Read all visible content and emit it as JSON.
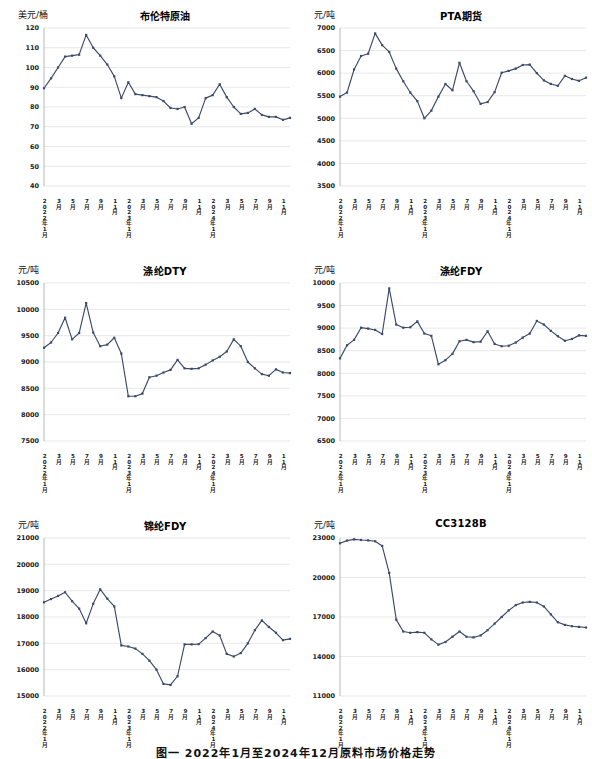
{
  "caption": "图一 2022年1月至2024年12月原料市场价格走势",
  "accent_color": "#3c4a6b",
  "gridline_color": "#d9d9d9",
  "x_labels": [
    "2022年1月",
    "3月",
    "5月",
    "7月",
    "9月",
    "11月",
    "2023年1月",
    "3月",
    "5月",
    "7月",
    "9月",
    "11月",
    "2024年1月",
    "3月",
    "5月",
    "7月",
    "9月",
    "11月"
  ],
  "charts": [
    {
      "chart_data": {
        "type": "line",
        "title": "布伦特原油",
        "ylabel": "美元/桶",
        "xlabel": "",
        "ylim": [
          40,
          120
        ],
        "yticks": [
          40,
          50,
          60,
          70,
          80,
          90,
          100,
          110,
          120
        ],
        "grid": true,
        "legend": "none",
        "x": [
          "2022-01",
          "2022-02",
          "2022-03",
          "2022-04",
          "2022-05",
          "2022-06",
          "2022-07",
          "2022-08",
          "2022-09",
          "2022-10",
          "2022-11",
          "2022-12",
          "2023-01",
          "2023-02",
          "2023-03",
          "2023-04",
          "2023-05",
          "2023-06",
          "2023-07",
          "2023-08",
          "2023-09",
          "2023-10",
          "2023-11",
          "2023-12",
          "2024-01",
          "2024-02",
          "2024-03",
          "2024-04",
          "2024-05",
          "2024-06",
          "2024-07",
          "2024-08",
          "2024-09",
          "2024-10",
          "2024-11",
          "2024-12"
        ],
        "values": [
          89.5,
          94.5,
          100.0,
          105.5,
          106.0,
          106.5,
          116.5,
          110.0,
          106.0,
          101.5,
          95.5,
          84.5,
          92.5,
          86.5,
          86.0,
          85.5,
          85.0,
          83.0,
          79.5,
          79.0,
          80.0,
          71.5,
          74.5,
          84.5,
          86.0,
          91.5,
          85.0,
          80.0,
          76.5,
          77.0,
          79.0,
          76.0,
          75.0,
          75.0,
          73.5,
          74.5
        ]
      }
    },
    {
      "chart_data": {
        "type": "line",
        "title": "PTA期货",
        "ylabel": "元/吨",
        "xlabel": "",
        "ylim": [
          3500,
          7000
        ],
        "yticks": [
          3500,
          4000,
          4500,
          5000,
          5500,
          6000,
          6500,
          7000
        ],
        "grid": true,
        "legend": "none",
        "x": [
          "2022-01",
          "2022-02",
          "2022-03",
          "2022-04",
          "2022-05",
          "2022-06",
          "2022-07",
          "2022-08",
          "2022-09",
          "2022-10",
          "2022-11",
          "2022-12",
          "2023-01",
          "2023-02",
          "2023-03",
          "2023-04",
          "2023-05",
          "2023-06",
          "2023-07",
          "2023-08",
          "2023-09",
          "2023-10",
          "2023-11",
          "2023-12",
          "2024-01",
          "2024-02",
          "2024-03",
          "2024-04",
          "2024-05",
          "2024-06",
          "2024-07",
          "2024-08",
          "2024-09",
          "2024-10",
          "2024-11",
          "2024-12"
        ],
        "values": [
          5480,
          5570,
          6080,
          6380,
          6430,
          6880,
          6620,
          6470,
          6100,
          5820,
          5570,
          5380,
          5000,
          5170,
          5480,
          5760,
          5620,
          6230,
          5820,
          5600,
          5320,
          5360,
          5580,
          6010,
          6050,
          6100,
          6180,
          6190,
          6000,
          5840,
          5760,
          5720,
          5940,
          5870,
          5830,
          5900
        ]
      }
    },
    {
      "chart_data": {
        "type": "line",
        "title": "涤纶DTY",
        "ylabel": "元/吨",
        "xlabel": "",
        "ylim": [
          7500,
          10500
        ],
        "yticks": [
          7500,
          8000,
          8500,
          9000,
          9500,
          10000,
          10500
        ],
        "grid": true,
        "legend": "none",
        "x": [
          "2022-01",
          "2022-02",
          "2022-03",
          "2022-04",
          "2022-05",
          "2022-06",
          "2022-07",
          "2022-08",
          "2022-09",
          "2022-10",
          "2022-11",
          "2022-12",
          "2023-01",
          "2023-02",
          "2023-03",
          "2023-04",
          "2023-05",
          "2023-06",
          "2023-07",
          "2023-08",
          "2023-09",
          "2023-10",
          "2023-11",
          "2023-12",
          "2024-01",
          "2024-02",
          "2024-03",
          "2024-04",
          "2024-05",
          "2024-06",
          "2024-07",
          "2024-08",
          "2024-09",
          "2024-10",
          "2024-11",
          "2024-12"
        ],
        "values": [
          9270,
          9370,
          9550,
          9840,
          9430,
          9550,
          10120,
          9560,
          9300,
          9330,
          9460,
          9160,
          8350,
          8350,
          8400,
          8710,
          8740,
          8800,
          8850,
          9040,
          8880,
          8870,
          8880,
          8950,
          9030,
          9100,
          9200,
          9430,
          9300,
          9000,
          8880,
          8770,
          8740,
          8860,
          8800,
          8790
        ]
      }
    },
    {
      "chart_data": {
        "type": "line",
        "title": "涤纶FDY",
        "ylabel": "元/吨",
        "xlabel": "",
        "ylim": [
          6500,
          10000
        ],
        "yticks": [
          6500,
          7000,
          7500,
          8000,
          8500,
          9000,
          9500,
          10000
        ],
        "grid": true,
        "legend": "none",
        "x": [
          "2022-01",
          "2022-02",
          "2022-03",
          "2022-04",
          "2022-05",
          "2022-06",
          "2022-07",
          "2022-08",
          "2022-09",
          "2022-10",
          "2022-11",
          "2022-12",
          "2023-01",
          "2023-02",
          "2023-03",
          "2023-04",
          "2023-05",
          "2023-06",
          "2023-07",
          "2023-08",
          "2023-09",
          "2023-10",
          "2023-11",
          "2023-12",
          "2024-01",
          "2024-02",
          "2024-03",
          "2024-04",
          "2024-05",
          "2024-06",
          "2024-07",
          "2024-08",
          "2024-09",
          "2024-10",
          "2024-11",
          "2024-12"
        ],
        "values": [
          8330,
          8620,
          8740,
          9010,
          8990,
          8960,
          8870,
          9880,
          9080,
          9010,
          9020,
          9150,
          8880,
          8830,
          8200,
          8290,
          8430,
          8710,
          8740,
          8690,
          8700,
          8930,
          8650,
          8600,
          8610,
          8680,
          8790,
          8880,
          9160,
          9080,
          8940,
          8820,
          8720,
          8760,
          8840,
          8830
        ]
      }
    },
    {
      "chart_data": {
        "type": "line",
        "title": "锦纶FDY",
        "ylabel": "元/吨",
        "xlabel": "",
        "ylim": [
          15000,
          21000
        ],
        "yticks": [
          15000,
          16000,
          17000,
          18000,
          19000,
          20000,
          21000
        ],
        "grid": true,
        "legend": "none",
        "x": [
          "2022-01",
          "2022-02",
          "2022-03",
          "2022-04",
          "2022-05",
          "2022-06",
          "2022-07",
          "2022-08",
          "2022-09",
          "2022-10",
          "2022-11",
          "2022-12",
          "2023-01",
          "2023-02",
          "2023-03",
          "2023-04",
          "2023-05",
          "2023-06",
          "2023-07",
          "2023-08",
          "2023-09",
          "2023-10",
          "2023-11",
          "2023-12",
          "2024-01",
          "2024-02",
          "2024-03",
          "2024-04",
          "2024-05",
          "2024-06",
          "2024-07",
          "2024-08",
          "2024-09",
          "2024-10",
          "2024-11",
          "2024-12"
        ],
        "values": [
          18560,
          18680,
          18800,
          18940,
          18600,
          18320,
          17760,
          18500,
          19050,
          18700,
          18400,
          16920,
          16880,
          16800,
          16600,
          16340,
          16000,
          15460,
          15420,
          15750,
          16960,
          16960,
          16970,
          17200,
          17450,
          17300,
          16600,
          16500,
          16630,
          17000,
          17500,
          17870,
          17620,
          17400,
          17120,
          17170
        ]
      }
    },
    {
      "chart_data": {
        "type": "line",
        "title": "CC3128B",
        "ylabel": "元/吨",
        "xlabel": "",
        "ylim": [
          11000,
          23000
        ],
        "yticks": [
          11000,
          14000,
          17000,
          20000,
          23000
        ],
        "grid": true,
        "legend": "none",
        "x": [
          "2022-01",
          "2022-02",
          "2022-03",
          "2022-04",
          "2022-05",
          "2022-06",
          "2022-07",
          "2022-08",
          "2022-09",
          "2022-10",
          "2022-11",
          "2022-12",
          "2023-01",
          "2023-02",
          "2023-03",
          "2023-04",
          "2023-05",
          "2023-06",
          "2023-07",
          "2023-08",
          "2023-09",
          "2023-10",
          "2023-11",
          "2023-12",
          "2024-01",
          "2024-02",
          "2024-03",
          "2024-04",
          "2024-05",
          "2024-06",
          "2024-07",
          "2024-08",
          "2024-09",
          "2024-10",
          "2024-11",
          "2024-12"
        ],
        "values": [
          22600,
          22800,
          22900,
          22850,
          22820,
          22750,
          22400,
          20350,
          16800,
          15900,
          15800,
          15850,
          15800,
          15300,
          14900,
          15100,
          15500,
          15900,
          15500,
          15450,
          15600,
          16000,
          16500,
          17000,
          17500,
          17900,
          18100,
          18150,
          18100,
          17800,
          17200,
          16600,
          16400,
          16300,
          16250,
          16200
        ]
      }
    }
  ]
}
